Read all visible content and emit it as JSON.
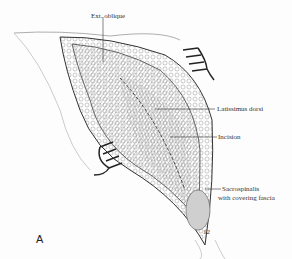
{
  "figure": {
    "panel_letter": "A",
    "labels": {
      "ext_oblique": "Ext. oblique",
      "latissimus_dorsi": "Latissimus dorsi",
      "incision": "Incision",
      "sacrospinalis_line1": "Sacrospinalis",
      "sacrospinalis_line2": "with covering fascia",
      "rib_number": "12"
    }
  }
}
